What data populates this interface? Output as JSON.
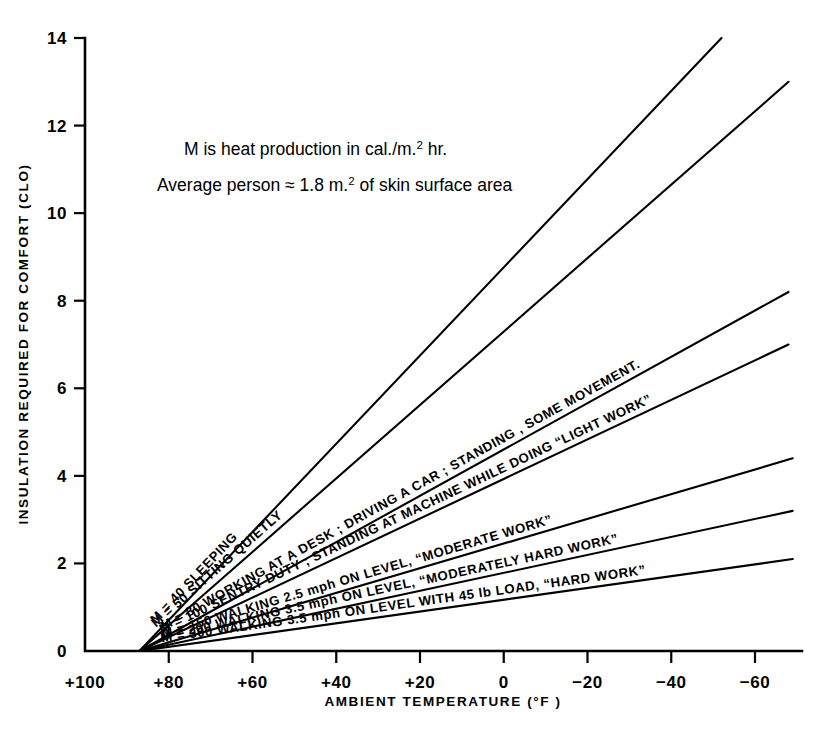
{
  "chart_data": {
    "type": "line",
    "title": "",
    "xlabel": "AMBIENT   TEMPERATURE (°F )",
    "ylabel": "INSULATION  REQUIRED  FOR  COMFORT  (CLO)",
    "xlim": [
      100,
      -68
    ],
    "ylim": [
      0,
      14
    ],
    "x_ticks": [
      100,
      80,
      60,
      40,
      20,
      0,
      -20,
      -40,
      -60
    ],
    "x_tick_labels": [
      "+100",
      "+80",
      "+60",
      "+40",
      "+20",
      "0",
      "−20",
      "−40",
      "−60"
    ],
    "y_ticks": [
      0,
      2,
      4,
      6,
      8,
      10,
      12,
      14
    ],
    "y_tick_labels": [
      "0",
      "2",
      "4",
      "6",
      "8",
      "10",
      "12",
      "14"
    ],
    "grid": false,
    "legend": "inline-curve-labels",
    "convergence_point": {
      "x": 87,
      "y": 0
    },
    "annotations": [
      {
        "id": "note-line-1",
        "text_parts": [
          "M is heat production in cal./m.",
          "2",
          " hr."
        ]
      },
      {
        "id": "note-line-2",
        "text_parts": [
          "Average person ≈ 1.8 m.",
          "2",
          " of skin surface area"
        ]
      }
    ],
    "series": [
      {
        "name": "M = 40",
        "m_value": 40,
        "label": "M = 40   SLEEPING",
        "activity": "SLEEPING",
        "points": [
          [
            87,
            0
          ],
          [
            -52,
            14.0
          ]
        ]
      },
      {
        "name": "M = 50",
        "m_value": 50,
        "label": "M = 50   SITTING  QUIETLY",
        "activity": "SITTING  QUIETLY",
        "points": [
          [
            87,
            0
          ],
          [
            -68,
            13.0
          ]
        ]
      },
      {
        "name": "M = 80",
        "m_value": 80,
        "label": "M = 80   WORKING AT A DESK ; DRIVING A CAR ; STANDING ,  SOME MOVEMENT.",
        "activity": "WORKING AT A DESK ; DRIVING A CAR ; STANDING ,  SOME MOVEMENT.",
        "points": [
          [
            87,
            0
          ],
          [
            -68,
            8.2
          ]
        ]
      },
      {
        "name": "M = 100",
        "m_value": 100,
        "label": "M = 100   SENTRY DUTY ; STANDING AT MACHINE WHILE DOING “LIGHT WORK”",
        "activity": "SENTRY DUTY ; STANDING AT MACHINE WHILE DOING “LIGHT WORK”",
        "points": [
          [
            87,
            0
          ],
          [
            -68,
            7.0
          ]
        ]
      },
      {
        "name": "M = 150",
        "m_value": 150,
        "label": "M = 150   WALKING 2.5 mph ON LEVEL, “MODERATE  WORK”",
        "activity": "WALKING 2.5 mph ON LEVEL, “MODERATE  WORK”",
        "points": [
          [
            87,
            0
          ],
          [
            -69,
            4.4
          ]
        ]
      },
      {
        "name": "M = 200",
        "m_value": 200,
        "label": "M = 200  WALKING 3.5 mph ON LEVEL, “MODERATELY  HARD WORK”",
        "activity": "WALKING 3.5 mph ON LEVEL, “MODERATELY  HARD WORK”",
        "points": [
          [
            87,
            0
          ],
          [
            -69,
            3.2
          ]
        ]
      },
      {
        "name": "M = 300",
        "m_value": 300,
        "label": "M = 300  WALKING 3.5 mph ON LEVEL WITH 45 lb LOAD, “HARD WORK”",
        "activity": "WALKING 3.5 mph ON LEVEL WITH 45 lb LOAD, “HARD WORK”",
        "points": [
          [
            87,
            0
          ],
          [
            -69,
            2.1
          ]
        ]
      }
    ]
  }
}
